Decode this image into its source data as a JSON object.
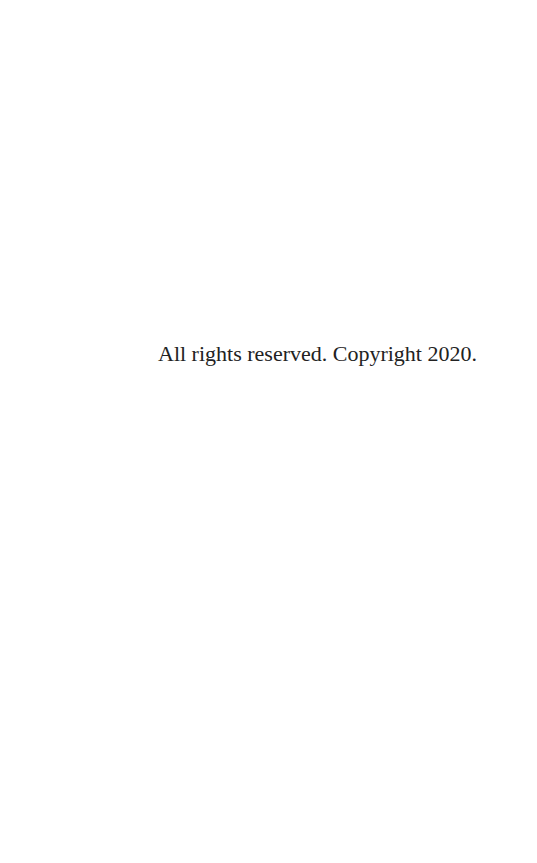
{
  "page": {
    "copyright_notice": "All rights reserved. Copyright 2020."
  }
}
